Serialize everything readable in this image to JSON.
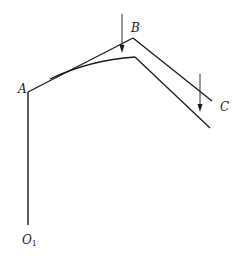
{
  "diagram": {
    "type": "portal frame deformation sketch",
    "labels": {
      "A": "A",
      "B": "B",
      "C": "C",
      "O1": "O",
      "O1_sub": "1"
    },
    "points": {
      "O1": [
        28,
        225
      ],
      "A": [
        28,
        92
      ],
      "B": [
        133,
        38
      ],
      "C": [
        212,
        101
      ]
    },
    "deformed_shape": {
      "curve_start": [
        50,
        78
      ],
      "peak": [
        135,
        58
      ],
      "end": [
        210,
        128
      ]
    },
    "loads": [
      {
        "name": "load-at-B",
        "x": 122,
        "y_from": 14,
        "y_to": 53
      },
      {
        "name": "load-at-C",
        "x": 200,
        "y_from": 74,
        "y_to": 112
      }
    ],
    "colors": {
      "line": "#1a1a1a",
      "background": "#ffffff"
    }
  }
}
